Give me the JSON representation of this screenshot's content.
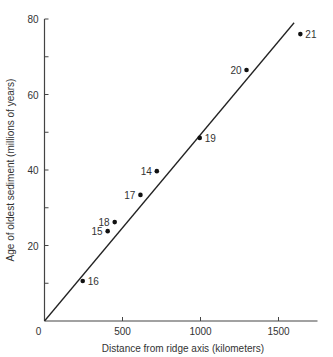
{
  "chart_data": {
    "type": "scatter",
    "title": "",
    "xlabel": "Distance from ridge axis (kilometers)",
    "ylabel": "Age of oldest sediment (millions of years)",
    "xlim": [
      0,
      1750
    ],
    "ylim": [
      0,
      80
    ],
    "x_ticks": [
      0,
      500,
      1000,
      1500
    ],
    "x_tick_labels": [
      "0",
      "500",
      "1000",
      "1500"
    ],
    "y_ticks": [
      0,
      10,
      20,
      30,
      40,
      50,
      60,
      70,
      80
    ],
    "y_tick_labels": [
      "0",
      "",
      "20",
      "",
      "40",
      "",
      "60",
      "",
      "80"
    ],
    "grid": false,
    "legend": null,
    "series": [
      {
        "name": "Drill sites",
        "points": [
          {
            "label": "16",
            "x": 245,
            "y": 10.6
          },
          {
            "label": "15",
            "x": 405,
            "y": 23.8
          },
          {
            "label": "18",
            "x": 450,
            "y": 26.2
          },
          {
            "label": "17",
            "x": 615,
            "y": 33.4
          },
          {
            "label": "14",
            "x": 720,
            "y": 39.7
          },
          {
            "label": "19",
            "x": 995,
            "y": 48.5
          },
          {
            "label": "20",
            "x": 1295,
            "y": 66.5
          },
          {
            "label": "21",
            "x": 1640,
            "y": 76
          }
        ]
      },
      {
        "name": "Best-fit line",
        "type": "line",
        "x": [
          0,
          1600
        ],
        "y": [
          0,
          79
        ]
      }
    ]
  }
}
